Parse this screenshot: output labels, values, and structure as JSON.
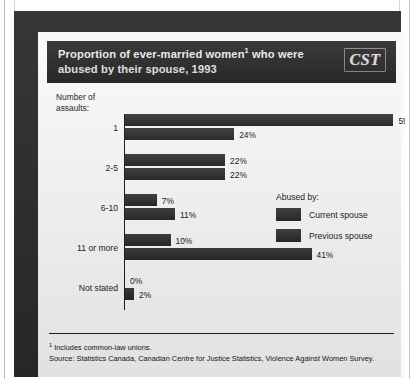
{
  "figure": {
    "title_line1": "Proportion of ever-married women",
    "title_superscript": "1",
    "title_line1_tail": " who were",
    "title_line2": "abused by their spouse, 1993",
    "logo_text": "CST",
    "logo_name": "cst-logo"
  },
  "axis_caption": "Number of\nassaults:",
  "legend": {
    "title": "Abused by:",
    "entries": [
      {
        "label": "Current spouse",
        "color": "#2b2829"
      },
      {
        "label": "Previous spouse",
        "color": "#2b2829"
      }
    ]
  },
  "footnotes": {
    "marker": "1",
    "note": " Includes common-law unions.",
    "source": "Source: Statistics Canada, Canadian Centre for Justice Statistics, Violence Against Women Survey."
  },
  "chart_data": {
    "type": "bar",
    "orientation": "horizontal",
    "xlabel": "",
    "ylabel": "Number of assaults:",
    "xlim": [
      0,
      62
    ],
    "grid": false,
    "legend_position": "right-middle",
    "value_suffix": "%",
    "categories": [
      "1",
      "2-5",
      "6-10",
      "11 or more",
      "Not stated"
    ],
    "series": [
      {
        "name": "Current spouse",
        "color": "#2b2829",
        "values": [
          59,
          22,
          7,
          10,
          0
        ],
        "labels": [
          "59%",
          "22%",
          "7%",
          "10%",
          "0%"
        ]
      },
      {
        "name": "Previous spouse",
        "color": "#2b2829",
        "values": [
          24,
          22,
          11,
          41,
          2
        ],
        "labels": [
          "24%",
          "22%",
          "11%",
          "41%",
          "2%"
        ]
      }
    ]
  }
}
